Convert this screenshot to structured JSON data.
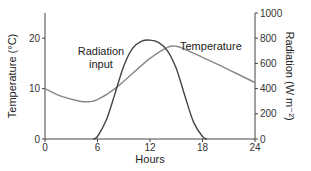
{
  "chart_data": {
    "type": "line",
    "title": "",
    "xlabel": "Hours",
    "ylabel": "Temperature (°C)",
    "ylabel_right": "Radiation (W m⁻²)",
    "xlim": [
      0,
      24
    ],
    "ylim": [
      0,
      25
    ],
    "ylim_right": [
      0,
      1000
    ],
    "x_ticks": [
      0,
      6,
      12,
      18,
      24
    ],
    "y_ticks": [
      0,
      10,
      20
    ],
    "y_ticks_right": [
      0,
      200,
      400,
      600,
      800,
      1000
    ],
    "grid": false,
    "legend": "inline labels",
    "series": [
      {
        "name": "Temperature",
        "axis": "left",
        "x": [
          0,
          2,
          4,
          5,
          6,
          8,
          10,
          12,
          14,
          15,
          16,
          18,
          20,
          22,
          24
        ],
        "values": [
          10,
          8.4,
          7.5,
          7.4,
          7.8,
          10,
          13,
          16,
          18.2,
          18.4,
          17.8,
          16.2,
          14.6,
          12.9,
          11.2
        ]
      },
      {
        "name": "Radiation input",
        "axis": "right",
        "x": [
          5.5,
          6,
          7,
          8,
          9,
          10,
          11,
          12,
          13,
          14,
          15,
          16,
          17,
          18,
          18.5
        ],
        "values": [
          0,
          20,
          150,
          360,
          580,
          720,
          775,
          785,
          765,
          700,
          560,
          340,
          130,
          20,
          0
        ]
      }
    ],
    "annotations": [
      "Radiation input",
      "Temperature"
    ]
  },
  "labels": {
    "xlabel": "Hours",
    "ylabel_left": "Temperature (°C)",
    "ylabel_right": "Radiation (W m⁻²)",
    "radiation_line1": "Radiation",
    "radiation_line2": "input",
    "temperature": "Temperature"
  }
}
